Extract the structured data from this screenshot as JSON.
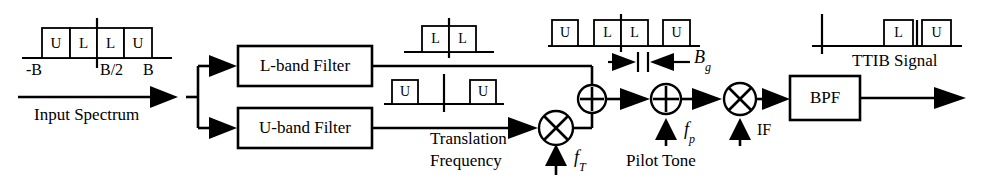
{
  "diagram": {
    "stroke_color": "#000000",
    "background_color": "#ffffff"
  },
  "input": {
    "caption": "Input Spectrum",
    "spectrum": {
      "name": "input-spectrum-plot",
      "boxes": [
        "U",
        "L",
        "L",
        "U"
      ],
      "axis_labels": [
        "-B",
        "B/2",
        "B"
      ]
    }
  },
  "blocks": [
    {
      "id": "l-band-filter",
      "label": "L-band Filter"
    },
    {
      "id": "u-band-filter",
      "label": "U-band Filter"
    },
    {
      "id": "bpf",
      "label": "BPF"
    }
  ],
  "operators": [
    {
      "id": "translation-mixer",
      "symbol": "⊗",
      "type": "mixer"
    },
    {
      "id": "combiner-adder",
      "symbol": "⊕",
      "type": "adder"
    },
    {
      "id": "pilot-adder",
      "symbol": "⊕",
      "type": "adder"
    },
    {
      "id": "if-mixer",
      "symbol": "⊗",
      "type": "mixer"
    }
  ],
  "signal_inputs": [
    {
      "id": "translation-frequency",
      "caption_line1": "Translation",
      "caption_line2": "Frequency",
      "symbol": "f",
      "subscript": "T"
    },
    {
      "id": "pilot-tone",
      "caption": "Pilot Tone",
      "symbol": "f",
      "subscript": "p"
    },
    {
      "id": "if-input",
      "caption": "IF",
      "symbol": "",
      "subscript": ""
    }
  ],
  "spectra": {
    "l_band_output": {
      "name": "l-band-spectrum-plot",
      "boxes": [
        "L",
        "L"
      ]
    },
    "u_band_output": {
      "name": "u-band-spectrum-plot",
      "boxes": [
        "U",
        "U"
      ]
    },
    "combined": {
      "name": "combined-spectrum-plot",
      "boxes": [
        "U",
        "L",
        "L",
        "U"
      ]
    },
    "ttib_output": {
      "name": "ttib-spectrum-plot",
      "boxes": [
        "L",
        "U"
      ],
      "caption": "TTIB Signal"
    }
  },
  "annotations": {
    "gap_bandwidth": {
      "symbol": "B",
      "subscript": "g"
    }
  }
}
